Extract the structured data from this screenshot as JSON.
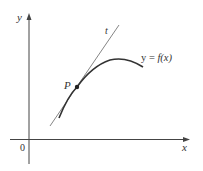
{
  "diagram": {
    "axes": {
      "x_label": "x",
      "y_label": "y",
      "origin_label": "0"
    },
    "curve": {
      "label_y": "y",
      "label_eq": " = ",
      "label_f": "f(x)",
      "full_label": "y = f(x)"
    },
    "tangent": {
      "label": "t"
    },
    "point": {
      "label": "P"
    },
    "colors": {
      "axis": "#444444",
      "curve": "#333333",
      "tangent": "#666666",
      "point": "#222222",
      "text": "#333333"
    }
  }
}
